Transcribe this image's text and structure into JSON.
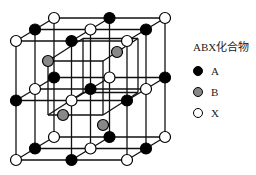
{
  "legend": {
    "title": "ABX化合物",
    "items": [
      {
        "label": "A",
        "color": "#000000"
      },
      {
        "label": "B",
        "color": "#888888"
      },
      {
        "label": "X",
        "color": "#ffffff"
      }
    ]
  },
  "lattice": {
    "origin": [
      16,
      41
    ],
    "step": [
      55.5,
      59.5
    ],
    "depth_offset": [
      19,
      -11.5
    ],
    "nodes": [
      [
        [
          "X",
          "A",
          "X"
        ],
        [
          "A",
          "X",
          "A"
        ],
        [
          "X",
          "A",
          "X"
        ]
      ],
      [
        [
          "A",
          "X",
          "A"
        ],
        [
          "X",
          "A",
          "X"
        ],
        [
          "A",
          "X",
          "A"
        ]
      ],
      [
        [
          "X",
          "A",
          "X"
        ],
        [
          "A",
          "X",
          "A"
        ],
        [
          "X",
          "A",
          "X"
        ]
      ]
    ],
    "inner_cube": {
      "corners_front": [
        [
          48,
          61
        ],
        [
          103,
          61
        ],
        [
          48,
          115
        ],
        [
          103,
          115
        ]
      ],
      "offset": [
        14,
        -9
      ],
      "b_positions": [
        [
          48,
          61
        ],
        [
          117,
          52
        ],
        [
          63,
          115
        ],
        [
          103,
          125
        ]
      ]
    }
  }
}
